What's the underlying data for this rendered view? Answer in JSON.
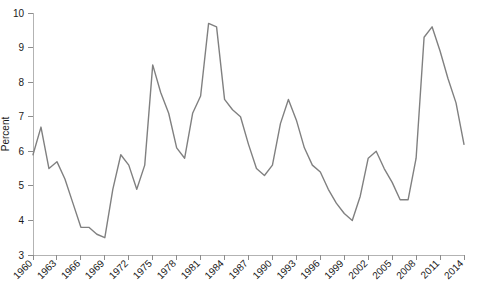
{
  "chart_data": {
    "type": "line",
    "title": "",
    "xlabel": "",
    "ylabel": "Percent",
    "xlim": [
      1960,
      2014
    ],
    "ylim": [
      3,
      10
    ],
    "grid": false,
    "legend": false,
    "line_color": "#808080",
    "axis_color": "#b3b3b3",
    "x_tick_step": 3,
    "y_tick_step": 1,
    "x_tick_labels": [
      "1960",
      "1963",
      "1966",
      "1969",
      "1972",
      "1975",
      "1978",
      "1981",
      "1984",
      "1987",
      "1990",
      "1993",
      "1996",
      "1999",
      "2002",
      "2005",
      "2008",
      "2011",
      "2014"
    ],
    "y_tick_labels": [
      "3",
      "4",
      "5",
      "6",
      "7",
      "8",
      "9",
      "10"
    ],
    "x_tick_values": [
      1960,
      1963,
      1966,
      1969,
      1972,
      1975,
      1978,
      1981,
      1984,
      1987,
      1990,
      1993,
      1996,
      1999,
      2002,
      2005,
      2008,
      2011,
      2014
    ],
    "y_tick_values": [
      3,
      4,
      5,
      6,
      7,
      8,
      9,
      10
    ],
    "x": [
      1960,
      1961,
      1962,
      1963,
      1964,
      1965,
      1966,
      1967,
      1968,
      1969,
      1970,
      1971,
      1972,
      1973,
      1974,
      1975,
      1976,
      1977,
      1978,
      1979,
      1980,
      1981,
      1982,
      1983,
      1984,
      1985,
      1986,
      1987,
      1988,
      1989,
      1990,
      1991,
      1992,
      1993,
      1994,
      1995,
      1996,
      1997,
      1998,
      1999,
      2000,
      2001,
      2002,
      2003,
      2004,
      2005,
      2006,
      2007,
      2008,
      2009,
      2010,
      2011,
      2012,
      2013,
      2014
    ],
    "values": [
      5.9,
      6.7,
      5.5,
      5.7,
      5.2,
      4.5,
      3.8,
      3.8,
      3.6,
      3.5,
      4.9,
      5.9,
      5.6,
      4.9,
      5.6,
      8.5,
      7.7,
      7.1,
      6.1,
      5.8,
      7.1,
      7.6,
      9.7,
      9.6,
      7.5,
      7.2,
      7.0,
      6.2,
      5.5,
      5.3,
      5.6,
      6.8,
      7.5,
      6.9,
      6.1,
      5.6,
      5.4,
      4.9,
      4.5,
      4.2,
      4.0,
      4.7,
      5.8,
      6.0,
      5.5,
      5.1,
      4.6,
      4.6,
      5.8,
      9.3,
      9.6,
      8.9,
      8.1,
      7.4,
      6.2
    ]
  }
}
